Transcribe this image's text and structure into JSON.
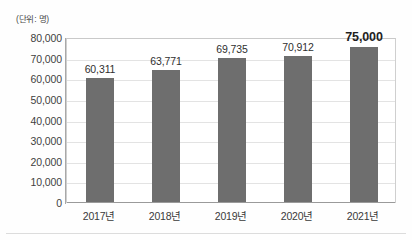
{
  "unit_label": "(단위: 명)",
  "chart_data": {
    "type": "bar",
    "title": "",
    "subtitle": "",
    "xlabel": "",
    "ylabel": "(단위: 명)",
    "categories": [
      "2017년",
      "2018년",
      "2019년",
      "2020년",
      "2021년"
    ],
    "values": [
      60311,
      63771,
      69735,
      70912,
      75000
    ],
    "data_labels": [
      "60,311",
      "63,771",
      "69,735",
      "70,912",
      "75,000"
    ],
    "emphasized_index": 4,
    "ylim": [
      0,
      80000
    ],
    "ytick_step": 10000,
    "ytick_labels": [
      "0",
      "10,000",
      "20,000",
      "30,000",
      "40,000",
      "50,000",
      "60,000",
      "70,000",
      "80,000"
    ],
    "ytick_values": [
      0,
      10000,
      20000,
      30000,
      40000,
      50000,
      60000,
      70000,
      80000
    ],
    "grid": true,
    "grid_axis": "y",
    "legend": false,
    "legend_position": "none",
    "bar_color": "#6e6e6e",
    "gridline_color": "#e3e3e3",
    "axis_color": "#a8a8a8",
    "label_color": "#2f2f2f"
  }
}
